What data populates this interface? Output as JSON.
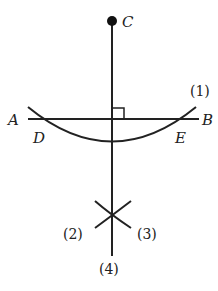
{
  "diagram": {
    "type": "geometric construction: perpendicular from point to line",
    "points": {
      "C": "C",
      "A": "A",
      "B": "B",
      "D": "D",
      "E": "E"
    },
    "steps": [
      "(1)",
      "(2)",
      "(3)",
      "(4)"
    ],
    "colors": {
      "stroke": "#222222",
      "background": "#ffffff"
    }
  }
}
